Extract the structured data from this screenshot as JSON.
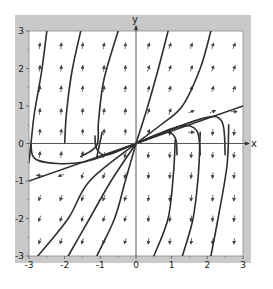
{
  "figure": {
    "type": "phase-portrait",
    "colors": {
      "background": "#ffffff",
      "frame": "#c8c8c8",
      "plot_bg": "#ffffff",
      "axis": "#333333",
      "curve": "#2e2e2e",
      "arrow": "#444444",
      "label": "#222222"
    }
  },
  "chart_data": {
    "type": "direction-field",
    "xlabel": "x",
    "ylabel": "y",
    "xlim": [
      -3,
      3
    ],
    "ylim": [
      -3,
      3
    ],
    "x_ticks": [
      -3,
      -2,
      -1,
      0,
      1,
      2,
      3
    ],
    "y_ticks": [
      -3,
      -2,
      -1,
      0,
      1,
      2,
      3
    ],
    "x_tick_labels": [
      "-3",
      "-2",
      "-1",
      "0",
      "1",
      "2",
      "3"
    ],
    "y_tick_labels": [
      "-3",
      "-2",
      "-1",
      "0",
      "1",
      "2",
      "3"
    ],
    "grid": false,
    "straight_line": {
      "slope": 0.3333,
      "from": [
        -3,
        -1
      ],
      "to": [
        3,
        1
      ],
      "note": "invariant line through origin"
    },
    "trajectories_upper": [
      [
        [
          -3.0,
          -0.5
        ],
        [
          -2.95,
          -0.05
        ],
        [
          -2.85,
          0.8
        ],
        [
          -2.65,
          1.9
        ],
        [
          -2.5,
          3.0
        ]
      ],
      [
        [
          -2.0,
          0.0
        ],
        [
          -1.95,
          0.8
        ],
        [
          -1.8,
          1.9
        ],
        [
          -1.55,
          3.0
        ]
      ],
      [
        [
          -1.55,
          -0.35
        ],
        [
          -1.1,
          -0.05
        ],
        [
          -1.05,
          0.6
        ],
        [
          -0.9,
          1.7
        ],
        [
          -0.5,
          3.0
        ]
      ],
      [
        [
          -1.1,
          -0.37
        ],
        [
          -0.95,
          0.3
        ]
      ],
      [
        [
          0.0,
          0.0
        ],
        [
          0.3,
          0.9
        ],
        [
          0.6,
          1.9
        ],
        [
          0.9,
          3.0
        ]
      ],
      [
        [
          0.0,
          0.0
        ],
        [
          0.7,
          0.5
        ],
        [
          1.3,
          1.0
        ],
        [
          1.8,
          2.0
        ],
        [
          2.1,
          3.0
        ]
      ]
    ],
    "trajectories_hooks_right": [
      [
        [
          0.0,
          0.0
        ],
        [
          0.8,
          0.3
        ],
        [
          1.1,
          0.15
        ],
        [
          1.15,
          -0.3
        ]
      ],
      [
        [
          0.0,
          0.0
        ],
        [
          1.2,
          0.45
        ],
        [
          1.7,
          0.35
        ],
        [
          1.8,
          -0.3
        ]
      ],
      [
        [
          0.0,
          0.0
        ],
        [
          1.8,
          0.65
        ],
        [
          2.4,
          0.6
        ],
        [
          2.5,
          -0.3
        ]
      ]
    ],
    "trajectories_hooks_left": [
      [
        [
          0.0,
          0.0
        ],
        [
          -1.5,
          -0.5
        ],
        [
          -2.75,
          -0.45
        ],
        [
          -2.95,
          0.0
        ]
      ],
      [
        [
          0.0,
          0.0
        ],
        [
          -0.8,
          -0.3
        ],
        [
          -1.1,
          -0.15
        ],
        [
          -1.15,
          0.2
        ]
      ]
    ],
    "trajectories_lower": [
      [
        [
          0.0,
          0.0
        ],
        [
          -1.3,
          -1.0
        ],
        [
          -1.9,
          -2.0
        ],
        [
          -2.75,
          -3.0
        ]
      ],
      [
        [
          0.0,
          0.0
        ],
        [
          -0.7,
          -1.0
        ],
        [
          -1.3,
          -2.0
        ],
        [
          -1.9,
          -3.0
        ]
      ],
      [
        [
          0.0,
          0.0
        ],
        [
          -0.3,
          -1.0
        ],
        [
          -0.6,
          -2.0
        ],
        [
          -1.1,
          -3.0
        ]
      ],
      [
        [
          2.6,
          0.5
        ],
        [
          2.55,
          -0.6
        ],
        [
          2.3,
          -2.0
        ],
        [
          2.1,
          -3.0
        ]
      ],
      [
        [
          1.8,
          0.3
        ],
        [
          1.75,
          -0.8
        ],
        [
          1.6,
          -2.0
        ],
        [
          1.3,
          -3.0
        ]
      ],
      [
        [
          1.1,
          0.1
        ],
        [
          1.05,
          -0.8
        ],
        [
          0.9,
          -2.0
        ],
        [
          0.5,
          -3.0
        ]
      ]
    ],
    "arrow_grid": {
      "x": [
        -2.7,
        -2.1,
        -1.5,
        -0.9,
        -0.3,
        0.35,
        0.95,
        1.55,
        2.15,
        2.75
      ],
      "y": [
        2.6,
        2.0,
        1.45,
        0.85,
        0.3,
        -0.3,
        -0.85,
        -1.45,
        -2.0,
        -2.6
      ],
      "direction_rule": "arrows point up (tilting right for x>0) above the line y=x/3 and down (tilting left) below it"
    }
  },
  "axes": {
    "x_axis_label": "x",
    "y_axis_label": "y"
  }
}
